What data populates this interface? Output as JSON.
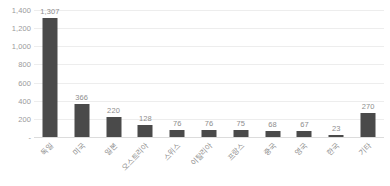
{
  "chart_data": {
    "type": "bar",
    "title": "",
    "xlabel": "",
    "ylabel": "",
    "ylim": [
      0,
      1400
    ],
    "grid": true,
    "legend": "none",
    "orientation": "vertical",
    "categories": [
      "독일",
      "미국",
      "일본",
      "오스트리아",
      "스위스",
      "이탈리아",
      "프랑스",
      "중국",
      "영국",
      "한국",
      "기타"
    ],
    "values": [
      1307,
      366,
      220,
      128,
      76,
      76,
      75,
      68,
      67,
      23,
      270
    ],
    "value_labels": [
      "1,307",
      "366",
      "220",
      "128",
      "76",
      "76",
      "75",
      "68",
      "67",
      "23",
      "270"
    ],
    "y_ticks": [
      0,
      200,
      400,
      600,
      800,
      1000,
      1200,
      1400
    ],
    "y_tick_labels": [
      "-",
      "200",
      "400",
      "600",
      "800",
      "1,000",
      "1,200",
      "1,400"
    ],
    "colors": {
      "bar": "#4a4a4a",
      "gridline": "#ededed",
      "baseline": "#dcdcdc",
      "tick_text": "#9a9a9a",
      "label_text": "#8e8e8e",
      "background": "#ffffff"
    }
  }
}
